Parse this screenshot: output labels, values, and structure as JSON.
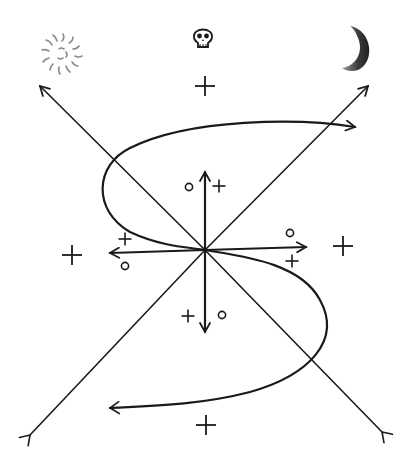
{
  "diagram": {
    "title": "",
    "colors": {
      "ink": "#1a1a1a",
      "background": "#ffffff",
      "moon": "#555555",
      "sun": "#8a8a8a"
    },
    "symbols": [
      {
        "name": "sun-icon",
        "glyph": "sun",
        "x": 62,
        "y": 54
      },
      {
        "name": "skull-icon",
        "glyph": "skull",
        "x": 203,
        "y": 36
      },
      {
        "name": "moon-icon",
        "glyph": "crescent-moon",
        "x": 356,
        "y": 48
      }
    ],
    "origin": {
      "x": 205,
      "y": 250
    },
    "lines": [
      {
        "name": "diagonal-nw-arrow",
        "from": [
          205,
          250
        ],
        "to": [
          40,
          86
        ],
        "head": "arrow"
      },
      {
        "name": "diagonal-ne-arrow",
        "from": [
          205,
          250
        ],
        "to": [
          368,
          86
        ],
        "head": "arrow"
      },
      {
        "name": "diagonal-sw-tail",
        "from": [
          205,
          250
        ],
        "to": [
          30,
          435
        ],
        "head": "fletch"
      },
      {
        "name": "diagonal-se-tail",
        "from": [
          205,
          250
        ],
        "to": [
          382,
          432
        ],
        "head": "fletch"
      },
      {
        "name": "axis-up-arrow",
        "from": [
          205,
          250
        ],
        "to": [
          205,
          172
        ],
        "head": "arrow"
      },
      {
        "name": "axis-down-arrow",
        "from": [
          205,
          250
        ],
        "to": [
          205,
          332
        ],
        "head": "arrow"
      },
      {
        "name": "axis-left-arrow",
        "from": [
          205,
          250
        ],
        "to": [
          110,
          253
        ],
        "head": "arrow"
      },
      {
        "name": "axis-right-arrow",
        "from": [
          205,
          250
        ],
        "to": [
          306,
          247
        ],
        "head": "arrow"
      }
    ],
    "marks": [
      {
        "type": "plus",
        "label": "+",
        "x": 205,
        "y": 86,
        "size": 20
      },
      {
        "type": "plus",
        "label": "+",
        "x": 72,
        "y": 255,
        "size": 20
      },
      {
        "type": "plus",
        "label": "+",
        "x": 343,
        "y": 246,
        "size": 20
      },
      {
        "type": "plus",
        "label": "+",
        "x": 206,
        "y": 425,
        "size": 20
      },
      {
        "type": "plus",
        "label": "+",
        "x": 219,
        "y": 186,
        "size": 13
      },
      {
        "type": "plus",
        "label": "+",
        "x": 125,
        "y": 239,
        "size": 13
      },
      {
        "type": "plus",
        "label": "+",
        "x": 292,
        "y": 261,
        "size": 13
      },
      {
        "type": "plus",
        "label": "+",
        "x": 188,
        "y": 316,
        "size": 13
      },
      {
        "type": "circle",
        "label": "o",
        "x": 189,
        "y": 187
      },
      {
        "type": "circle",
        "label": "o",
        "x": 125,
        "y": 266
      },
      {
        "type": "circle",
        "label": "o",
        "x": 290,
        "y": 233
      },
      {
        "type": "circle",
        "label": "o",
        "x": 222,
        "y": 315
      }
    ],
    "curve": {
      "name": "s-curve",
      "path": "M 355 127 C 300 118, 190 118, 130 148 C 95 165, 92 210, 130 232 C 160 246, 185 247, 205 250 C 240 256, 300 262, 320 300 C 342 340, 310 375, 250 392 C 200 405, 150 406, 110 408",
      "start_head": "fletch",
      "end_head": "arrow"
    }
  }
}
